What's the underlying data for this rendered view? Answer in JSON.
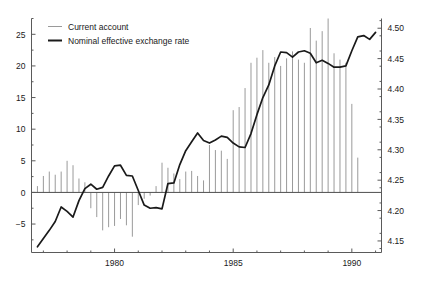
{
  "chart_data": {
    "type": "line",
    "title": "",
    "subtitle": "",
    "xlabel": "",
    "ylabel": "",
    "grid": false,
    "legend_position": "top-left",
    "legend": [
      {
        "name": "Current account",
        "style": "thin-vertical-bars",
        "color": "#9a9a9a",
        "axis": "left"
      },
      {
        "name": "Nominal effective exchange rate",
        "style": "thick-line",
        "color": "#1a1a1a",
        "axis": "right"
      }
    ],
    "xaxis": {
      "ticks": [
        1980,
        1985,
        1990
      ],
      "tick_labels": [
        "1980",
        "1985",
        "1990"
      ],
      "minor_tick_interval": 1,
      "xlim": [
        1976.5,
        1991.25
      ]
    },
    "yaxis_left": {
      "ticks": [
        -5,
        0,
        5,
        10,
        15,
        20,
        25
      ],
      "tick_labels": [
        "−5",
        "0",
        "5",
        "10",
        "15",
        "20",
        "25"
      ],
      "ylim": [
        -9.5,
        27.5
      ],
      "zero_line": 0
    },
    "yaxis_right": {
      "ticks": [
        4.15,
        4.2,
        4.25,
        4.3,
        4.35,
        4.4,
        4.45,
        4.5
      ],
      "tick_labels": [
        "4.15",
        "4.20",
        "4.25",
        "4.30",
        "4.35",
        "4.40",
        "4.45",
        "4.50"
      ],
      "ylim": [
        4.131,
        4.516
      ]
    },
    "series": [
      {
        "name": "Current account",
        "axis": "left",
        "render": "bars",
        "x": [
          1976.75,
          1977.0,
          1977.25,
          1977.5,
          1977.75,
          1978.0,
          1978.25,
          1978.5,
          1978.75,
          1979.0,
          1979.25,
          1979.5,
          1979.75,
          1980.0,
          1980.25,
          1980.5,
          1980.75,
          1981.0,
          1981.25,
          1981.5,
          1981.75,
          1982.0,
          1982.25,
          1982.5,
          1982.75,
          1983.0,
          1983.25,
          1983.5,
          1983.75,
          1984.0,
          1984.25,
          1984.5,
          1984.75,
          1985.0,
          1985.25,
          1985.5,
          1985.75,
          1986.0,
          1986.25,
          1986.5,
          1986.75,
          1987.0,
          1987.25,
          1987.5,
          1987.75,
          1988.0,
          1988.25,
          1988.5,
          1988.75,
          1989.0,
          1989.25,
          1989.5,
          1989.75,
          1990.0,
          1990.25,
          1990.5,
          1990.75
        ],
        "values": [
          1.0,
          2.6,
          3.3,
          2.8,
          3.3,
          5.0,
          4.3,
          2.2,
          1.6,
          -2.5,
          -3.9,
          -6.0,
          -5.5,
          -5.3,
          -4.2,
          -5.2,
          -7.0,
          -2.0,
          -1.0,
          -0.5,
          1.0,
          4.7,
          3.9,
          3.0,
          2.1,
          3.3,
          3.4,
          2.6,
          1.9,
          7.5,
          6.7,
          6.6,
          5.3,
          13.0,
          13.5,
          16.5,
          20.5,
          21.3,
          22.5,
          20.5,
          21.4,
          20.0,
          21.2,
          22.3,
          21.0,
          20.5,
          26.0,
          24.0,
          25.5,
          27.5,
          22.0,
          21.0,
          20.5,
          14.0,
          5.5,
          0.0,
          0.0
        ]
      },
      {
        "name": "Nominal effective exchange rate",
        "axis": "right",
        "render": "line",
        "x": [
          1976.75,
          1977.0,
          1977.25,
          1977.5,
          1977.75,
          1978.0,
          1978.25,
          1978.5,
          1978.75,
          1979.0,
          1979.25,
          1979.5,
          1979.75,
          1980.0,
          1980.25,
          1980.5,
          1980.75,
          1981.0,
          1981.25,
          1981.5,
          1981.75,
          1982.0,
          1982.25,
          1982.5,
          1982.75,
          1983.0,
          1983.25,
          1983.5,
          1983.75,
          1984.0,
          1984.25,
          1984.5,
          1984.75,
          1985.0,
          1985.25,
          1985.5,
          1985.75,
          1986.0,
          1986.25,
          1986.5,
          1986.75,
          1987.0,
          1987.25,
          1987.5,
          1987.75,
          1988.0,
          1988.25,
          1988.5,
          1988.75,
          1989.0,
          1989.25,
          1989.5,
          1989.75,
          1990.0,
          1990.25,
          1990.5,
          1990.75,
          1991.0
        ],
        "values_left_scale": [
          -8.6,
          -7.3,
          -6.0,
          -4.6,
          -2.3,
          -3.0,
          -3.9,
          -1.3,
          0.6,
          1.3,
          0.5,
          0.8,
          2.6,
          4.2,
          4.3,
          2.7,
          2.6,
          0.3,
          -2.0,
          -2.5,
          -2.4,
          -2.6,
          1.4,
          1.5,
          4.4,
          6.6,
          8.0,
          9.4,
          8.2,
          7.8,
          8.3,
          8.9,
          8.7,
          7.8,
          7.2,
          7.1,
          9.3,
          12.3,
          15.0,
          17.0,
          20.0,
          22.2,
          22.1,
          21.4,
          22.2,
          22.4,
          22.0,
          20.5,
          20.9,
          20.4,
          19.8,
          19.8,
          20.0,
          22.4,
          24.6,
          24.8,
          24.2,
          25.3
        ],
        "values_right_axis": [
          4.146,
          4.159,
          4.172,
          4.187,
          4.211,
          4.204,
          4.195,
          4.222,
          4.242,
          4.248,
          4.24,
          4.243,
          4.262,
          4.279,
          4.28,
          4.263,
          4.262,
          4.238,
          4.214,
          4.209,
          4.21,
          4.208,
          4.25,
          4.251,
          4.281,
          4.304,
          4.319,
          4.333,
          4.321,
          4.317,
          4.322,
          4.328,
          4.326,
          4.317,
          4.31,
          4.309,
          4.332,
          4.363,
          4.391,
          4.412,
          4.443,
          4.466,
          4.465,
          4.458,
          4.466,
          4.468,
          4.464,
          4.446,
          4.451,
          4.445,
          4.439,
          4.439,
          4.441,
          4.468,
          4.491,
          4.493,
          4.487,
          4.498
        ]
      }
    ]
  },
  "legend": {
    "current_account_label": "Current account",
    "exchange_rate_label": "Nominal effective exchange rate"
  },
  "colors": {
    "bar": "#9a9a9a",
    "line": "#1a1a1a",
    "axis": "#555555",
    "text": "#1a1a1a",
    "background": "#ffffff"
  }
}
